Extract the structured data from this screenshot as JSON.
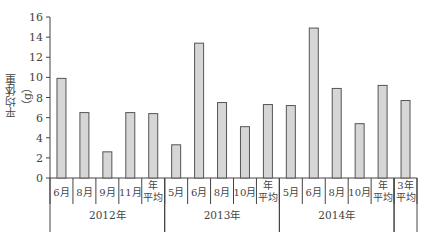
{
  "chart_data": {
    "type": "bar",
    "title": "",
    "xlabel": "",
    "ylabel": "平均体重（g）",
    "ylim": [
      0,
      16
    ],
    "yticks": [
      0,
      2,
      4,
      6,
      8,
      10,
      12,
      14,
      16
    ],
    "grid": false,
    "legend": null,
    "groups": [
      {
        "label": "2012年",
        "categories": [
          "6月",
          "8月",
          "9月",
          "11月",
          "年\n平均"
        ]
      },
      {
        "label": "2013年",
        "categories": [
          "5月",
          "6月",
          "8月",
          "10月",
          "年\n平均"
        ]
      },
      {
        "label": "2014年",
        "categories": [
          "5月",
          "6月",
          "8月",
          "10月",
          "年\n平均"
        ]
      },
      {
        "label": "",
        "categories": [
          "3年\n平均"
        ]
      }
    ],
    "categories": [
      "2012年 6月",
      "2012年 8月",
      "2012年 9月",
      "2012年 11月",
      "2012年 年平均",
      "2013年 5月",
      "2013年 6月",
      "2013年 8月",
      "2013年 10月",
      "2013年 年平均",
      "2014年 5月",
      "2014年 6月",
      "2014年 8月",
      "2014年 10月",
      "2014年 年平均",
      "3年平均"
    ],
    "values": [
      9.9,
      6.5,
      2.6,
      6.5,
      6.4,
      3.3,
      13.4,
      7.5,
      5.1,
      7.3,
      7.2,
      14.9,
      8.9,
      5.4,
      9.2,
      7.7
    ],
    "colors": {
      "bar_fill": "#d6d6d6",
      "bar_stroke": "#555555",
      "axis": "#444444"
    }
  }
}
